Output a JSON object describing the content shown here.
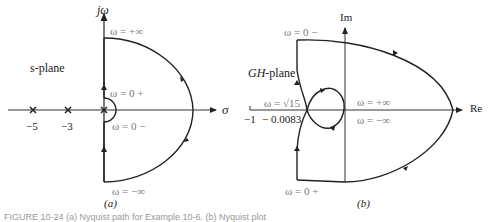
{
  "panel_a": {
    "sublabel": "(a)",
    "axis_y_label": "jω",
    "axis_x_label": "σ",
    "plane_label": "s-plane",
    "omega_top": "ω = +∞",
    "omega_0plus": "ω = 0 +",
    "omega_0minus": "ω = 0 −",
    "omega_bottom": "ω = −∞",
    "poles": [
      "−5",
      "−3",
      "0"
    ],
    "pole_labels": [
      "−5",
      "−3"
    ]
  },
  "panel_b": {
    "sublabel": "(b)",
    "axis_y_label": "Im",
    "axis_x_label": "Re",
    "plane_label": "GH-plane",
    "omega_0minus": "ω = 0 −",
    "omega_sqrt15": "ω = √15",
    "omega_pinf": "ω = +∞",
    "omega_minf": "ω = −∞",
    "omega_0plus": "ω = 0 +",
    "tick_minus1": "−1",
    "tick_crossing": "− 0.0083"
  },
  "caption": "FIGURE 10-24 (a) Nyquist path for Example 10-6. (b) Nyquist plot"
}
